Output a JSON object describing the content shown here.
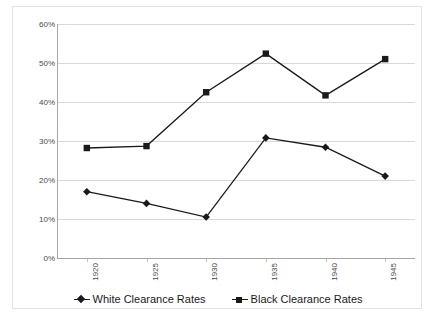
{
  "chart_data": {
    "type": "line",
    "title": "",
    "xlabel": "",
    "ylabel": "",
    "x": [
      "1920",
      "1925",
      "1930",
      "1935",
      "1940",
      "1945"
    ],
    "categories": [
      "1920",
      "1925",
      "1930",
      "1935",
      "1940",
      "1945"
    ],
    "series": [
      {
        "name": "White Clearance Rates",
        "marker": "diamond",
        "color": "#1a1a1a",
        "values": [
          17.0,
          14.0,
          10.5,
          30.8,
          28.4,
          21.0
        ]
      },
      {
        "name": "Black Clearance Rates",
        "marker": "square",
        "color": "#1a1a1a",
        "values": [
          28.2,
          28.7,
          42.5,
          52.4,
          41.7,
          51.0
        ]
      }
    ],
    "ylim": [
      0,
      60
    ],
    "ytick_values": [
      0,
      10,
      20,
      30,
      40,
      50,
      60
    ],
    "ytick_labels": [
      "0%",
      "10%",
      "20%",
      "30%",
      "40%",
      "50%",
      "60%"
    ],
    "grid": true,
    "grid_axis": "y",
    "legend_position": "bottom",
    "legend_entries": [
      "White Clearance Rates",
      "Black Clearance Rates"
    ],
    "colors": {
      "series_line": "#1a1a1a",
      "gridline": "#d9d9d9",
      "axis": "#a6a6a6",
      "frame_border": "#e3e3e3",
      "tick_label": "#4a4a4a",
      "legend_label": "#1a1a1a",
      "background": "#ffffff"
    }
  }
}
